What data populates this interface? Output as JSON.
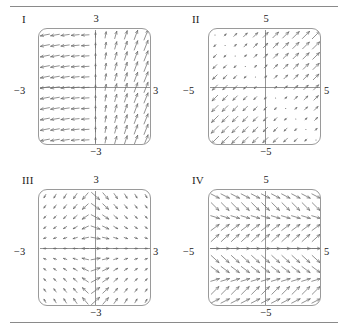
{
  "figure": {
    "title_rules": [
      "top-rule",
      "bottom-rule"
    ],
    "panel_count": 4
  },
  "panels": [
    {
      "id": "I",
      "label": "I",
      "axis": {
        "top": "3",
        "bottom": "−3",
        "left": "−3",
        "right": "3"
      },
      "range": [
        -3,
        3
      ],
      "grid_n": 11,
      "field": "x-only",
      "description": "Arrows point left in the left half and rotate to upward in the right half; magnitude grows with |x|."
    },
    {
      "id": "II",
      "label": "II",
      "axis": {
        "top": "5",
        "bottom": "−5",
        "left": "−5",
        "right": "5"
      },
      "range": [
        -5,
        5
      ],
      "grid_n": 11,
      "field": "saddle",
      "description": "Saddle/source pattern: arrows flow outward along the diagonal in quadrants I and III and inward toward the center in quadrants II and IV."
    },
    {
      "id": "III",
      "label": "III",
      "axis": {
        "top": "3",
        "bottom": "−3",
        "left": "−3",
        "right": "3"
      },
      "range": [
        -3,
        3
      ],
      "grid_n": 11,
      "field": "vertical-convergence",
      "description": "Arrows point toward the vertical axis from the left and away from it on the right; near the y-axis the arrows align vertically toward the origin."
    },
    {
      "id": "IV",
      "label": "IV",
      "axis": {
        "top": "5",
        "bottom": "−5",
        "left": "−5",
        "right": "5"
      },
      "range": [
        -5,
        5
      ],
      "grid_n": 11,
      "field": "y-periodic-bands",
      "description": "Horizontal bands of uniform arrows that alternate between pointing down-right and up-right as y changes; direction depends only on y."
    }
  ],
  "style": {
    "arrow_color": "#6d6d6d",
    "box_border_color": "#9a9a9a",
    "axis_color": "#7a7a7a",
    "rule_color": "#8a8a8a",
    "text_color": "#1a1a1a",
    "background": "#ffffff"
  }
}
